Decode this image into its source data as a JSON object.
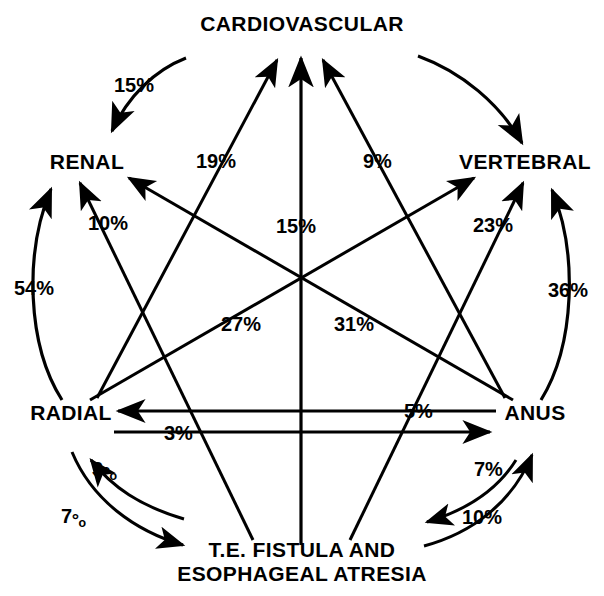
{
  "diagram": {
    "type": "association-network",
    "background_color": "#ffffff",
    "stroke_color": "#000000",
    "nodes": [
      {
        "id": "cardiovascular",
        "label": "CARDIOVASCULAR",
        "position": "top"
      },
      {
        "id": "renal",
        "label": "RENAL",
        "position": "upper-left"
      },
      {
        "id": "vertebral",
        "label": "VERTEBRAL",
        "position": "upper-right"
      },
      {
        "id": "radial",
        "label": "RADIAL",
        "position": "lower-left"
      },
      {
        "id": "anus",
        "label": "ANUS",
        "position": "lower-right"
      },
      {
        "id": "te_fistula",
        "label_line1": "T.E. FISTULA AND",
        "label_line2": "ESOPHAGEAL ATRESIA",
        "position": "bottom"
      }
    ],
    "edges": [
      {
        "id": "cardio-renal",
        "from": "cardiovascular",
        "to": "renal",
        "value": "15%",
        "shape": "arc"
      },
      {
        "id": "cardio-vertebral",
        "from": "cardiovascular",
        "to": "vertebral",
        "value": "",
        "shape": "arc"
      },
      {
        "id": "radial-cardio",
        "from": "radial",
        "to": "cardiovascular",
        "value": "19%",
        "shape": "line"
      },
      {
        "id": "anus-cardio",
        "from": "anus",
        "to": "cardiovascular",
        "value": "9%",
        "shape": "line"
      },
      {
        "id": "tef-cardio",
        "from": "te_fistula",
        "to": "cardiovascular",
        "value": "15%",
        "shape": "line"
      },
      {
        "id": "anus-renal",
        "from": "anus",
        "to": "renal",
        "value": "10%",
        "shape": "line"
      },
      {
        "id": "radial-renal",
        "from": "radial",
        "to": "renal",
        "value": "54%",
        "shape": "arc"
      },
      {
        "id": "radial-vertebral",
        "from": "radial",
        "to": "vertebral",
        "value": "23%",
        "shape": "line"
      },
      {
        "id": "anus-vertebral",
        "from": "anus",
        "to": "vertebral",
        "value": "36%",
        "shape": "arc"
      },
      {
        "id": "tef-renal",
        "from": "te_fistula",
        "to": "renal",
        "value": "27%",
        "shape": "line"
      },
      {
        "id": "tef-vertebral",
        "from": "te_fistula",
        "to": "vertebral",
        "value": "31%",
        "shape": "line"
      },
      {
        "id": "anus-radial",
        "from": "anus",
        "to": "radial",
        "value": "5%",
        "shape": "line"
      },
      {
        "id": "radial-anus",
        "from": "radial",
        "to": "anus",
        "value": "3%",
        "shape": "line"
      },
      {
        "id": "tef-radial",
        "from": "te_fistula",
        "to": "radial",
        "value": "3°ₒ",
        "shape": "arc"
      },
      {
        "id": "radial-tef",
        "from": "radial",
        "to": "te_fistula",
        "value": "7°ₒ",
        "shape": "arc"
      },
      {
        "id": "anus-tef",
        "from": "anus",
        "to": "te_fistula",
        "value": "7%",
        "shape": "arc"
      },
      {
        "id": "tef-anus",
        "from": "te_fistula",
        "to": "anus",
        "value": "10%",
        "shape": "arc"
      }
    ],
    "labels": {
      "cardiovascular": "CARDIOVASCULAR",
      "renal": "RENAL",
      "vertebral": "VERTEBRAL",
      "radial": "RADIAL",
      "anus": "ANUS",
      "te_fistula_line1": "T.E. FISTULA AND",
      "te_fistula_line2": "ESOPHAGEAL ATRESIA",
      "pct_cardio_renal": "15%",
      "pct_radial_cardio": "19%",
      "pct_anus_cardio": "9%",
      "pct_anus_renal": "10%",
      "pct_tef_cardio": "15%",
      "pct_radial_vertebral": "23%",
      "pct_radial_renal": "54%",
      "pct_anus_vertebral": "36%",
      "pct_tef_renal": "27%",
      "pct_tef_vertebral": "31%",
      "pct_anus_radial": "5%",
      "pct_radial_anus": "3%",
      "pct_tef_radial_num": "3",
      "pct_tef_radial_sym": "°ₒ",
      "pct_radial_tef_num": "7",
      "pct_radial_tef_sym": "°ₒ",
      "pct_anus_tef": "7%",
      "pct_tef_anus": "10%"
    }
  }
}
